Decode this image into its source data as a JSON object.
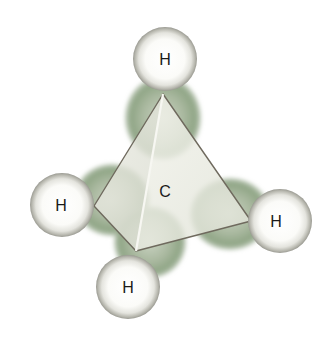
{
  "diagram": {
    "central_atom": {
      "label": "C",
      "x": 165,
      "y": 191
    },
    "hydrogens": [
      {
        "id": "top",
        "label": "H",
        "cx": 165,
        "cy": 59,
        "r": 32
      },
      {
        "id": "left",
        "label": "H",
        "cx": 62,
        "cy": 205,
        "r": 32
      },
      {
        "id": "right",
        "label": "H",
        "cx": 280,
        "cy": 221,
        "r": 32
      },
      {
        "id": "bottom",
        "label": "H",
        "cx": 128,
        "cy": 287,
        "r": 32
      }
    ],
    "tetrahedron": {
      "vertices": {
        "top": [
          163,
          94
        ],
        "left": [
          94,
          206
        ],
        "right": [
          251,
          221
        ],
        "bottom": [
          136,
          251
        ]
      }
    },
    "colors": {
      "orbital_green": "#8fa585",
      "hydrogen_edge": "#9a9a92",
      "tetra_face": "#e6e6dc",
      "tetra_edge": "#6f6a5e",
      "label": "#1a1a1a",
      "background": "#ffffff"
    }
  }
}
